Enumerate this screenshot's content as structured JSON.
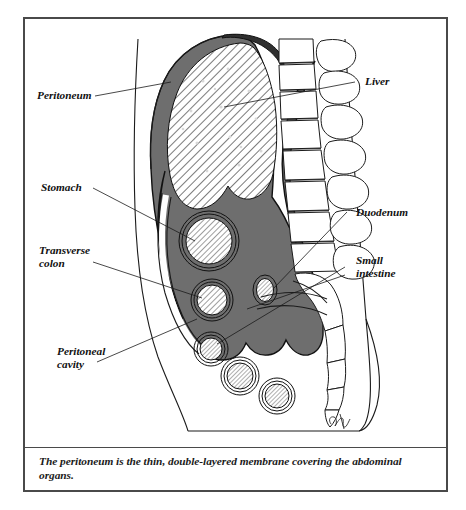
{
  "figure": {
    "caption": "The peritoneum is the thin, double-layered membrane covering the abdominal organs.",
    "signature": "artist-signature"
  },
  "labels": {
    "left": [
      {
        "id": "peritoneum",
        "name": "label-peritoneum",
        "lines": [
          "Peritoneum"
        ]
      },
      {
        "id": "stomach",
        "name": "label-stomach",
        "lines": [
          "Stomach"
        ]
      },
      {
        "id": "transverse_colon",
        "name": "label-transverse-colon",
        "lines": [
          "Transverse",
          "colon"
        ]
      },
      {
        "id": "peritoneal_cavity",
        "name": "label-peritoneal-cavity",
        "lines": [
          "Peritoneal",
          "cavity"
        ]
      }
    ],
    "right": [
      {
        "id": "liver",
        "name": "label-liver",
        "lines": [
          "Liver"
        ]
      },
      {
        "id": "duodenum",
        "name": "label-duodenum",
        "lines": [
          "Duodenum"
        ]
      },
      {
        "id": "small_intestine",
        "name": "label-small-intestine",
        "lines": [
          "Small",
          "intestine"
        ]
      }
    ]
  },
  "label_text": {
    "peritoneum": "Peritoneum",
    "stomach": "Stomach",
    "transverse_colon_1": "Transverse",
    "transverse_colon_2": "colon",
    "peritoneal_cavity_1": "Peritoneal",
    "peritoneal_cavity_2": "cavity",
    "liver": "Liver",
    "duodenum": "Duodenum",
    "small_intestine_1": "Small",
    "small_intestine_2": "intestine"
  },
  "colors": {
    "frame_border": "#4a4a4a",
    "ink": "#1b1b1b",
    "peritoneum_fill": "#6e6e6e",
    "organ_hatch_bg": "#ffffff",
    "bone_fill": "#ffffff",
    "page_background": "#ffffff"
  },
  "structures": {
    "liver": "large hatched oval organ, upper abdomen",
    "stomach": "hatched circle with double ring, mid abdomen",
    "transverse_colon": "hatched circle with double ring, below stomach",
    "duodenum": "small hatched oval adjacent to spine",
    "small_intestine": "three hatched loops in lower abdomen",
    "peritoneum": "dark gray double-layered membrane lining the cavity",
    "peritoneal_cavity": "dark gray space enclosed by the peritoneum",
    "spine": "lumbar vertebral bodies with spinous processes",
    "sacrum": "sacrum and coccyx curving posteriorly and inferiorly",
    "body_wall": "anterior and posterior torso outline"
  }
}
